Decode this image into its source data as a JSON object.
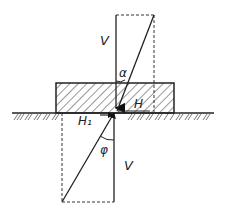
{
  "diagram": {
    "type": "force-decomposition",
    "labels": {
      "upper_vertical": "V",
      "upper_angle": "α",
      "horizontal_force": "H",
      "horizontal_reaction": "H₁",
      "lower_angle": "φ",
      "lower_vertical": "V"
    },
    "colors": {
      "line": "#222222",
      "background": "#ffffff"
    }
  }
}
